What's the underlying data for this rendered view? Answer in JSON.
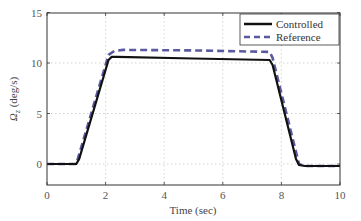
{
  "chart_data": {
    "type": "line",
    "title": "",
    "xlabel": "Time (sec)",
    "ylabel": "Ω_z (deg/s)",
    "xlim": [
      0,
      10
    ],
    "ylim": [
      -2,
      15
    ],
    "xticks": [
      0,
      2,
      4,
      6,
      8,
      10
    ],
    "yticks": [
      0,
      5,
      10,
      15
    ],
    "grid": true,
    "legend_position": "upper right",
    "series": [
      {
        "name": "Controlled",
        "style": "solid",
        "color": "#111111",
        "x": [
          0,
          1.0,
          1.1,
          2.1,
          2.2,
          2.4,
          5.0,
          7.6,
          7.7,
          8.5,
          8.6,
          8.8,
          10
        ],
        "y": [
          0,
          0,
          0.5,
          10.3,
          10.6,
          10.6,
          10.45,
          10.3,
          9.8,
          0.5,
          -0.1,
          -0.2,
          -0.2
        ]
      },
      {
        "name": "Reference",
        "style": "dashed",
        "color": "#5a5aa0",
        "x": [
          0,
          1.0,
          2.1,
          2.3,
          2.6,
          5.0,
          7.6,
          7.7,
          8.6,
          8.8,
          10
        ],
        "y": [
          0,
          0,
          10.8,
          11.2,
          11.3,
          11.25,
          11.1,
          10.5,
          0,
          -0.2,
          -0.2
        ]
      }
    ]
  },
  "axes": {
    "xlabel": "Time (sec)",
    "ylabel_main": "Ω",
    "ylabel_sub": "z",
    "ylabel_unit": " (deg/s)",
    "xtick_labels": [
      "0",
      "2",
      "4",
      "6",
      "8",
      "10"
    ],
    "ytick_labels": [
      "0",
      "5",
      "10",
      "15"
    ]
  },
  "legend": {
    "items": [
      {
        "label": "Controlled"
      },
      {
        "label": "Reference"
      }
    ]
  },
  "colors": {
    "controlled": "#111111",
    "reference": "#5a5aa0",
    "grid": "#c8c8c8",
    "axis": "#333333"
  }
}
